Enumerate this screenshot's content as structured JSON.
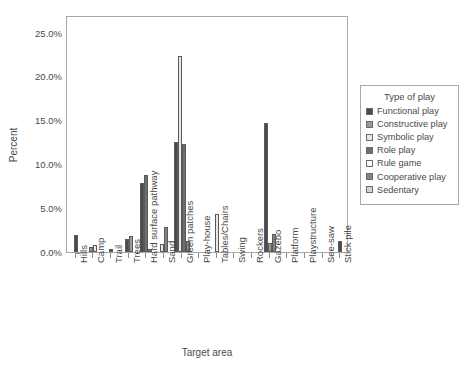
{
  "chart_data": {
    "type": "bar",
    "title": "",
    "xlabel": "Target area",
    "ylabel": "Percent",
    "ylim": [
      0,
      27
    ],
    "ytick_values": [
      0,
      5,
      10,
      15,
      20,
      25
    ],
    "ytick_labels": [
      "0.0%",
      "5.0%",
      "10.0%",
      "15.0%",
      "20.0%",
      "25.0%"
    ],
    "grid": false,
    "legend_position": "right",
    "legend_title": "Type of play",
    "categories": [
      "Hills",
      "Camp",
      "Trail",
      "Trees",
      "Hard surface pathway",
      "Sand",
      "Green patches",
      "Play-house",
      "Tables/Chairs",
      "Swing",
      "Rockers",
      "Gazebo",
      "Platform",
      "Playstructure",
      "See-saw",
      "Stick pile"
    ],
    "series": [
      {
        "name": "Functional play",
        "color": "#4a4a4a",
        "values": [
          1.9,
          0.0,
          0.3,
          1.5,
          7.9,
          0.0,
          12.5,
          0.0,
          0.0,
          0.0,
          0.0,
          14.7,
          0.0,
          0.0,
          0.0,
          1.3
        ]
      },
      {
        "name": "Constructive play",
        "color": "#9a9a9a",
        "values": [
          0.0,
          0.6,
          0.0,
          1.8,
          0.0,
          0.0,
          0.0,
          0.0,
          0.0,
          0.0,
          0.0,
          1.0,
          0.0,
          0.0,
          0.0,
          0.0
        ]
      },
      {
        "name": "Symbolic play",
        "color": "#e8e8e8",
        "values": [
          0.0,
          0.8,
          0.0,
          0.0,
          0.0,
          0.9,
          22.3,
          0.0,
          4.3,
          0.0,
          0.0,
          0.0,
          0.0,
          0.0,
          0.0,
          0.0
        ]
      },
      {
        "name": "Role play",
        "color": "#6e6e6e",
        "values": [
          0.0,
          0.0,
          0.0,
          0.0,
          8.8,
          0.0,
          12.3,
          0.0,
          0.0,
          0.0,
          0.0,
          0.0,
          0.0,
          0.0,
          0.0,
          0.0
        ]
      },
      {
        "name": "Rule game",
        "color": "#fbfbfb",
        "values": [
          0.0,
          0.0,
          0.0,
          0.0,
          0.0,
          0.0,
          0.0,
          0.0,
          0.0,
          0.0,
          0.0,
          0.0,
          0.0,
          0.0,
          0.0,
          0.0
        ]
      },
      {
        "name": "Cooperative play",
        "color": "#848484",
        "values": [
          0.0,
          0.0,
          0.0,
          0.0,
          0.4,
          2.8,
          1.3,
          0.0,
          0.0,
          0.0,
          0.0,
          2.0,
          0.0,
          0.0,
          0.0,
          0.0
        ]
      },
      {
        "name": "Sedentary",
        "color": "#d4d4d4",
        "values": [
          0.0,
          0.0,
          0.0,
          0.0,
          0.0,
          0.0,
          0.0,
          0.0,
          0.0,
          0.0,
          0.0,
          0.0,
          0.0,
          0.0,
          0.0,
          0.0
        ]
      }
    ]
  },
  "axes": {
    "y_title": "Percent",
    "x_title": "Target area"
  },
  "legend": {
    "title": "Type of play",
    "items": [
      {
        "label": "Functional play",
        "color": "#4a4a4a"
      },
      {
        "label": "Constructive play",
        "color": "#9a9a9a"
      },
      {
        "label": "Symbolic play",
        "color": "#e8e8e8"
      },
      {
        "label": "Role play",
        "color": "#6e6e6e"
      },
      {
        "label": "Rule game",
        "color": "#fdfdfd"
      },
      {
        "label": "Cooperative play",
        "color": "#848484"
      },
      {
        "label": "Sedentary",
        "color": "#d4d4d4"
      }
    ]
  }
}
